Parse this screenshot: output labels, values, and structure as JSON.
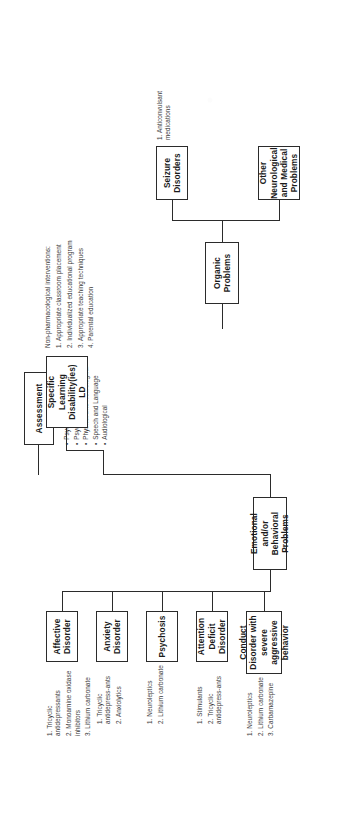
{
  "diagram": {
    "root": {
      "label": "Assessment",
      "bullets": [
        "Psychiatric",
        "Psychoeducational",
        "Physical and Neurological",
        "Speech and Language",
        "Audiological"
      ]
    },
    "branches": {
      "emotional": {
        "label": "Emotional and/or Behavioral Problems",
        "children": [
          {
            "label": "Affective Disorder",
            "items": [
              "1. Tricyclic antidepressants",
              "2. Monoamine oxidase inhibitors",
              "3. Lithium carbonate"
            ]
          },
          {
            "label": "Anxiety Disorder",
            "items": [
              "1. Tricyclic antidepress-ants",
              "2. Anxiolytics"
            ]
          },
          {
            "label": "Psychosis",
            "items": [
              "1. Neuroleptics",
              "2. Lithium carbonate"
            ]
          },
          {
            "label": "Attention Deficit Disorder",
            "items": [
              "1. Stimulants",
              "2. Tricyclic antidepress-ants"
            ]
          },
          {
            "label": "Conduct Disorder with severe aggressive behavior",
            "items": [
              "1. Neuroleptics",
              "2. Lithium carbonate",
              "3. Carbamazepine"
            ]
          }
        ]
      },
      "organic": {
        "label": "Organic Problems",
        "children": [
          {
            "label": "Other Neurological and Medical Problems",
            "items": []
          },
          {
            "label": "Seizure Disorders",
            "items": [
              "1. Anticonvulsant medications"
            ]
          }
        ]
      },
      "learning": {
        "label": "Specific Learning Disability(ies) LD",
        "heading": "Non-pharmacological interventions:",
        "items": [
          "1. Appropriate classroom placement",
          "2. Individualized educational program",
          "3. Appropriate teaching techniques",
          "4. Parental education"
        ]
      }
    },
    "colors": {
      "ink": "#2b2b2b",
      "paper": "#ffffff",
      "body_text": "#3a3a3a"
    }
  }
}
